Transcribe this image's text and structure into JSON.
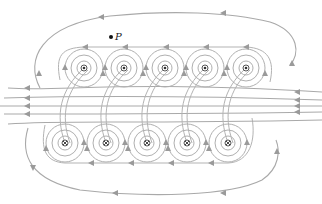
{
  "diagram": {
    "point_label": "P",
    "point_position": {
      "x": 111,
      "y": 37
    },
    "colors": {
      "field_line": "#a9a9a9",
      "arrow": "#9a9a9a",
      "conductor": "#333333",
      "background": "#ffffff"
    },
    "top_conductors": [
      {
        "x": 84,
        "y": 68,
        "symbol": "out-of-page"
      },
      {
        "x": 124,
        "y": 68,
        "symbol": "out-of-page"
      },
      {
        "x": 165,
        "y": 68,
        "symbol": "out-of-page"
      },
      {
        "x": 205,
        "y": 68,
        "symbol": "out-of-page"
      },
      {
        "x": 246,
        "y": 68,
        "symbol": "out-of-page"
      }
    ],
    "bottom_conductors": [
      {
        "x": 65,
        "y": 143,
        "symbol": "into-page"
      },
      {
        "x": 106,
        "y": 143,
        "symbol": "into-page"
      },
      {
        "x": 147,
        "y": 143,
        "symbol": "into-page"
      },
      {
        "x": 187,
        "y": 143,
        "symbol": "into-page"
      },
      {
        "x": 228,
        "y": 143,
        "symbol": "into-page"
      }
    ],
    "field_direction_middle": "left-to-right",
    "outer_loop_direction": "counterclockwise"
  }
}
